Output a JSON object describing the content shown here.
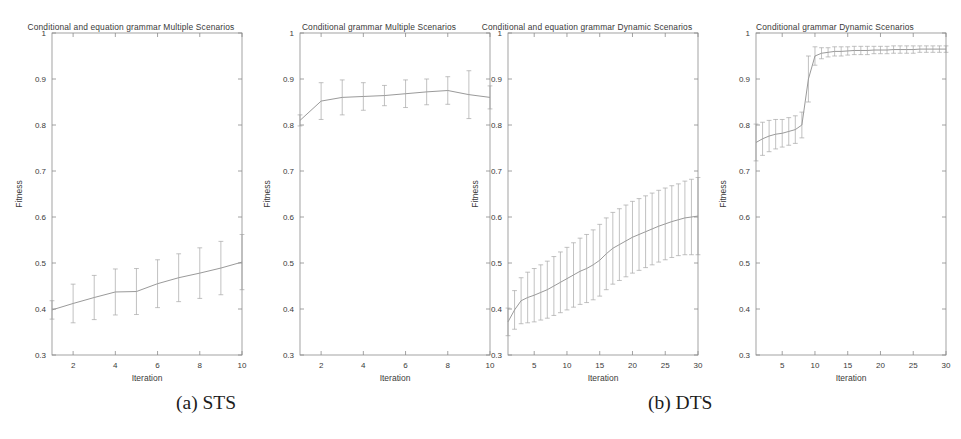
{
  "figure": {
    "captions": [
      {
        "id": "caption-a",
        "text": "(a) STS"
      },
      {
        "id": "caption-b",
        "text": "(b) DTS"
      }
    ],
    "axis_color": "#8c8c8c",
    "line_color": "#9a9a9a",
    "text_color": "#3a3a3a",
    "background": "#ffffff"
  },
  "chart_data": [
    {
      "type": "line",
      "title": "Conditional and equation grammar Multiple Scenarios",
      "xlabel": "Iteration",
      "ylabel": "Fitness",
      "xlim": [
        1,
        10
      ],
      "ylim": [
        0.3,
        1.0
      ],
      "xticks": [
        2,
        4,
        6,
        8,
        10
      ],
      "yticks": [
        0.3,
        0.4,
        0.5,
        0.6,
        0.7,
        0.8,
        0.9,
        1
      ],
      "ytick_labels": [
        "0.3",
        "0.4",
        "0.5",
        "0.6",
        "0.7",
        "0.8",
        "0.9",
        "1"
      ],
      "grid": false,
      "legend": "none",
      "errorbars": true,
      "x": [
        1,
        2,
        3,
        4,
        5,
        6,
        7,
        8,
        9,
        10
      ],
      "values": [
        0.398,
        0.412,
        0.425,
        0.437,
        0.438,
        0.455,
        0.468,
        0.478,
        0.489,
        0.502
      ],
      "yerr": [
        0.02,
        0.042,
        0.048,
        0.05,
        0.05,
        0.052,
        0.052,
        0.055,
        0.058,
        0.06
      ]
    },
    {
      "type": "line",
      "title": "Conditional grammar Multiple Scenarios",
      "xlabel": "Iteration",
      "ylabel": "Fitness",
      "xlim": [
        1,
        10
      ],
      "ylim": [
        0.3,
        1.0
      ],
      "xticks": [
        2,
        4,
        6,
        8,
        10
      ],
      "yticks": [
        0.3,
        0.4,
        0.5,
        0.6,
        0.7,
        0.8,
        0.9,
        1
      ],
      "ytick_labels": [
        "0.3",
        "0.4",
        "0.5",
        "0.6",
        "0.7",
        "0.8",
        "0.9",
        "1"
      ],
      "grid": false,
      "legend": "none",
      "errorbars": true,
      "x": [
        1,
        2,
        3,
        4,
        5,
        6,
        7,
        8,
        9,
        10
      ],
      "values": [
        0.81,
        0.852,
        0.86,
        0.862,
        0.864,
        0.868,
        0.872,
        0.875,
        0.866,
        0.86
      ],
      "yerr": [
        0.012,
        0.04,
        0.038,
        0.03,
        0.022,
        0.03,
        0.028,
        0.03,
        0.052,
        0.025
      ]
    },
    {
      "type": "line",
      "title": "Conditional and equation grammar Dynamic Scenarios",
      "xlabel": "Iteration",
      "ylabel": "Fitness",
      "xlim": [
        1,
        30
      ],
      "ylim": [
        0.3,
        1.0
      ],
      "xticks": [
        5,
        10,
        15,
        20,
        25,
        30
      ],
      "yticks": [
        0.3,
        0.4,
        0.5,
        0.6,
        0.7,
        0.8,
        0.9,
        1
      ],
      "ytick_labels": [
        "0.3",
        "0.4",
        "0.5",
        "0.6",
        "0.7",
        "0.8",
        "0.9",
        "1"
      ],
      "grid": false,
      "legend": "none",
      "errorbars": true,
      "x": [
        1,
        2,
        3,
        4,
        5,
        6,
        7,
        8,
        9,
        10,
        11,
        12,
        13,
        14,
        15,
        16,
        17,
        18,
        19,
        20,
        21,
        22,
        23,
        24,
        25,
        26,
        27,
        28,
        29,
        30
      ],
      "values": [
        0.372,
        0.398,
        0.418,
        0.425,
        0.43,
        0.436,
        0.442,
        0.45,
        0.458,
        0.466,
        0.474,
        0.482,
        0.488,
        0.496,
        0.506,
        0.52,
        0.532,
        0.54,
        0.548,
        0.556,
        0.562,
        0.568,
        0.574,
        0.58,
        0.585,
        0.59,
        0.594,
        0.598,
        0.6,
        0.602
      ],
      "yerr": [
        0.03,
        0.042,
        0.05,
        0.055,
        0.058,
        0.06,
        0.062,
        0.064,
        0.066,
        0.068,
        0.07,
        0.072,
        0.074,
        0.076,
        0.078,
        0.078,
        0.078,
        0.078,
        0.078,
        0.078,
        0.078,
        0.078,
        0.078,
        0.078,
        0.078,
        0.078,
        0.078,
        0.08,
        0.082,
        0.084
      ]
    },
    {
      "type": "line",
      "title": "Conditional grammar Dynamic Scenarios",
      "xlabel": "Iteration",
      "ylabel": "Fitness",
      "xlim": [
        1,
        30
      ],
      "ylim": [
        0.3,
        1.0
      ],
      "xticks": [
        5,
        10,
        15,
        20,
        25,
        30
      ],
      "yticks": [
        0.3,
        0.4,
        0.5,
        0.6,
        0.7,
        0.8,
        0.9,
        1
      ],
      "ytick_labels": [
        "0.3",
        "0.4",
        "0.5",
        "0.6",
        "0.7",
        "0.8",
        "0.9",
        "1"
      ],
      "grid": false,
      "legend": "none",
      "errorbars": true,
      "x": [
        1,
        2,
        3,
        4,
        5,
        6,
        7,
        8,
        9,
        10,
        11,
        12,
        13,
        14,
        15,
        16,
        17,
        18,
        19,
        20,
        21,
        22,
        23,
        24,
        25,
        26,
        27,
        28,
        29,
        30
      ],
      "values": [
        0.762,
        0.77,
        0.776,
        0.78,
        0.782,
        0.786,
        0.79,
        0.8,
        0.9,
        0.95,
        0.956,
        0.958,
        0.96,
        0.96,
        0.961,
        0.962,
        0.962,
        0.962,
        0.963,
        0.963,
        0.963,
        0.964,
        0.964,
        0.964,
        0.964,
        0.965,
        0.965,
        0.965,
        0.965,
        0.965
      ],
      "yerr": [
        0.04,
        0.036,
        0.034,
        0.032,
        0.03,
        0.03,
        0.03,
        0.028,
        0.05,
        0.02,
        0.012,
        0.01,
        0.01,
        0.01,
        0.009,
        0.009,
        0.009,
        0.009,
        0.008,
        0.008,
        0.008,
        0.008,
        0.008,
        0.008,
        0.008,
        0.007,
        0.007,
        0.007,
        0.007,
        0.007
      ]
    }
  ],
  "panel_geometry": [
    {
      "left": 0,
      "plot_x": 52,
      "plot_y": 33,
      "plot_w": 190,
      "plot_h": 322
    },
    {
      "left": 248,
      "plot_x": 52,
      "plot_y": 33,
      "plot_w": 190,
      "plot_h": 322
    },
    {
      "left": 456,
      "plot_x": 52,
      "plot_y": 33,
      "plot_w": 190,
      "plot_h": 322
    },
    {
      "left": 704,
      "plot_x": 52,
      "plot_y": 33,
      "plot_w": 190,
      "plot_h": 322
    }
  ]
}
